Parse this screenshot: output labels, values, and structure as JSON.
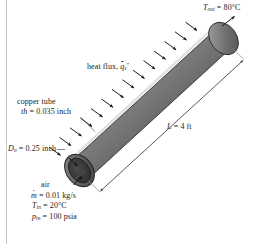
{
  "figure": {
    "background_color": "#ffffff",
    "border_color": "#b9b9b9",
    "tube": {
      "body_light": "#cfcfcf",
      "body_mid": "#8c8c8c",
      "body_dark": "#4a4a4a",
      "outline_color": "#2b2b2b",
      "wall_color": "#6e6e6e",
      "bore_color": "#3a3a3a"
    },
    "arrow_color": "#111111",
    "leader_color": "#4d4d4d",
    "dimension_color": "#3a3a3a",
    "heat_flux_arrow_count": 14
  },
  "labels": {
    "outlet_temperature": {
      "symbol": "T",
      "subscript": "out",
      "equals": " = ",
      "value": "80°C"
    },
    "heat_flux": {
      "text": "heat flux, ",
      "symbol": "q",
      "subscript": "s",
      "superscript": "″"
    },
    "copper_tube": {
      "text": "copper tube"
    },
    "thickness": {
      "symbol": "th",
      "equals": " = ",
      "value": "0.035 inch"
    },
    "outer_diameter": {
      "symbol": "D",
      "subscript": "o",
      "equals": " = ",
      "value": "0.25 inch"
    },
    "length": {
      "symbol": "L",
      "equals": " = ",
      "value": "4 ft"
    },
    "fluid": {
      "text": "air"
    },
    "mass_flow_rate": {
      "symbol": "m",
      "equals": " = ",
      "value": "0.01 kg/s"
    },
    "inlet_temperature": {
      "symbol": "T",
      "subscript": "in",
      "equals": " = ",
      "value": "20°C"
    },
    "inlet_pressure": {
      "symbol": "p",
      "subscript": "in",
      "equals": " = ",
      "value": "100 psia"
    }
  }
}
